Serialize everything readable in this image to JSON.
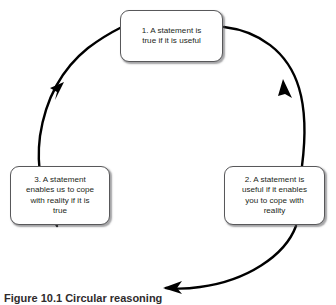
{
  "figure": {
    "caption": "Figure 10.1 Circular reasoning",
    "diagram_type": "circular-cycle",
    "direction": "clockwise",
    "stroke_color": "#000000",
    "box_border_color": "#58585a",
    "text_color": "#231f20",
    "background_color": "#ffffff"
  },
  "nodes": [
    {
      "id": "node-1",
      "number": "1.",
      "text": "1. A statement is\ntrue if it is useful",
      "position": "top"
    },
    {
      "id": "node-2",
      "number": "2.",
      "text": "2. A statement is\nuseful if it enables\nyou to cope with\nreality",
      "position": "bottom-right"
    },
    {
      "id": "node-3",
      "number": "3.",
      "text": "3. A statement\nenables us to cope\nwith reality if it is\ntrue",
      "position": "bottom-left"
    }
  ],
  "arrows": [
    {
      "id": "arrow-1-to-2",
      "from": "node-1",
      "to": "node-2",
      "label": "right-descending-arrowhead"
    },
    {
      "id": "arrow-2-to-3",
      "from": "node-2",
      "to": "node-3",
      "label": "bottom-leftward-arrowhead"
    },
    {
      "id": "arrow-3-to-1",
      "from": "node-3",
      "to": "node-1",
      "label": "left-ascending-arrowhead"
    }
  ]
}
